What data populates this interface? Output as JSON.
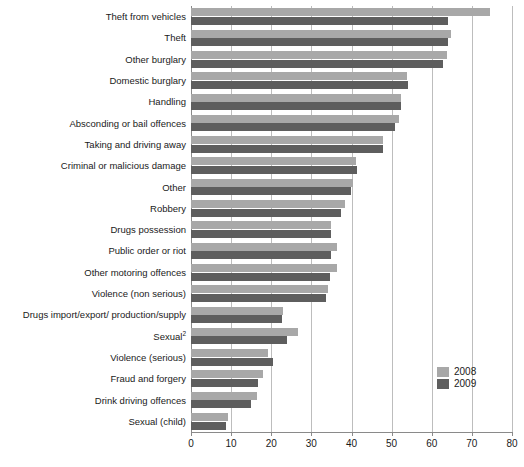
{
  "chart_data": {
    "type": "bar",
    "orientation": "horizontal",
    "title": "",
    "subtitle": "",
    "xlabel": "",
    "ylabel": "",
    "xlim": [
      0,
      80
    ],
    "xticks": [
      0,
      10,
      20,
      30,
      40,
      50,
      60,
      70,
      80
    ],
    "xtick_labels": [
      "0",
      "10",
      "20",
      "30",
      "40",
      "50",
      "60",
      "70",
      "80"
    ],
    "grid": true,
    "grid_axis": "x",
    "legend_position": "lower-right",
    "categories": [
      "Theft from vehicles",
      "Theft",
      "Other burglary",
      "Domestic burglary",
      "Handling",
      "Absconding or bail offences",
      "Taking and driving away",
      "Criminal or malicious damage",
      "Other",
      "Robbery",
      "Drugs possession",
      "Public order or riot",
      "Other motoring offences",
      "Violence (non serious)",
      "Drugs import/export/ production/supply",
      "Sexual",
      "Violence (serious)",
      "Fraud and forgery",
      "Drink driving offences",
      "Sexual (child)"
    ],
    "category_footnotes": {
      "Sexual": "2"
    },
    "series": [
      {
        "name": "2008",
        "color": "#a8a8a8",
        "values": [
          74.6,
          64.9,
          63.7,
          53.9,
          52.3,
          51.8,
          47.9,
          41.0,
          40.3,
          38.3,
          34.9,
          36.4,
          36.3,
          34.1,
          22.9,
          26.7,
          19.2,
          18.0,
          16.4,
          9.3
        ]
      },
      {
        "name": "2009",
        "color": "#5e5e5e",
        "values": [
          64.0,
          64.0,
          62.7,
          54.1,
          52.4,
          50.8,
          47.9,
          41.3,
          39.8,
          37.4,
          34.9,
          34.9,
          34.6,
          33.6,
          22.7,
          24.0,
          20.4,
          16.6,
          15.0,
          8.7
        ]
      }
    ]
  },
  "legend": {
    "entries": [
      {
        "label": "2008",
        "color": "#a8a8a8"
      },
      {
        "label": "2009",
        "color": "#5e5e5e"
      }
    ]
  },
  "colors": {
    "series_2008": "#a8a8a8",
    "series_2009": "#5e5e5e",
    "gridline": "#bdbdbd",
    "axis": "#8a8a8a",
    "text": "#1a1a1a",
    "background": "#ffffff"
  }
}
